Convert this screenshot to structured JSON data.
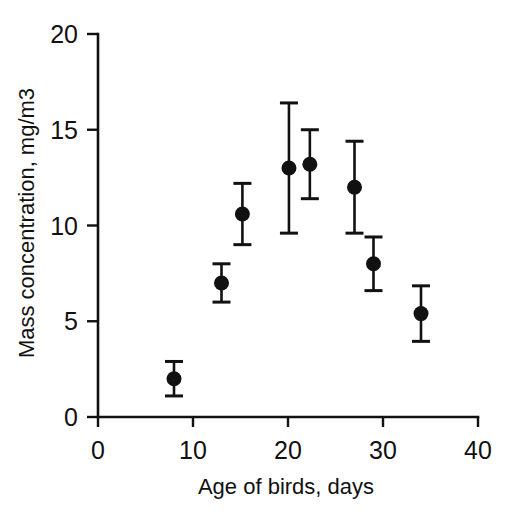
{
  "chart_data": {
    "type": "scatter",
    "title": "",
    "xlabel": "Age of birds, days",
    "ylabel": "Mass concentration, mg/m3",
    "xlim": [
      0,
      40
    ],
    "ylim": [
      0,
      20
    ],
    "xticks": [
      0,
      10,
      20,
      30,
      40
    ],
    "yticks": [
      0,
      5,
      10,
      15,
      20
    ],
    "xtick_labels": [
      "0",
      "10",
      "20",
      "30",
      "40"
    ],
    "ytick_labels": [
      "0",
      "5",
      "10",
      "15",
      "20"
    ],
    "grid": false,
    "legend": null,
    "marker_style": "filled-circle",
    "error_bars": "vertical-with-caps",
    "series": [
      {
        "name": "Mass concentration",
        "x": [
          8,
          13,
          15.2,
          20.1,
          22.3,
          27,
          29,
          34
        ],
        "values": [
          2.0,
          7.0,
          10.6,
          13.0,
          13.2,
          12.0,
          8.0,
          5.4
        ],
        "yerr": [
          0.9,
          1.0,
          1.6,
          3.4,
          1.8,
          2.4,
          1.4,
          1.45
        ],
        "points": [
          {
            "x": 8,
            "y": 2.0,
            "low": 1.1,
            "high": 2.9
          },
          {
            "x": 13,
            "y": 7.0,
            "low": 6.0,
            "high": 8.0
          },
          {
            "x": 15.2,
            "y": 10.6,
            "low": 9.0,
            "high": 12.2
          },
          {
            "x": 20.1,
            "y": 13.0,
            "low": 9.6,
            "high": 16.4
          },
          {
            "x": 22.3,
            "y": 13.2,
            "low": 11.4,
            "high": 15.0
          },
          {
            "x": 27,
            "y": 12.0,
            "low": 9.6,
            "high": 14.4
          },
          {
            "x": 29,
            "y": 8.0,
            "low": 6.6,
            "high": 9.4
          },
          {
            "x": 34,
            "y": 5.4,
            "low": 3.95,
            "high": 6.85
          }
        ]
      }
    ],
    "colors": {
      "marker": "#111111",
      "axis": "#111111",
      "background": "#ffffff"
    }
  }
}
